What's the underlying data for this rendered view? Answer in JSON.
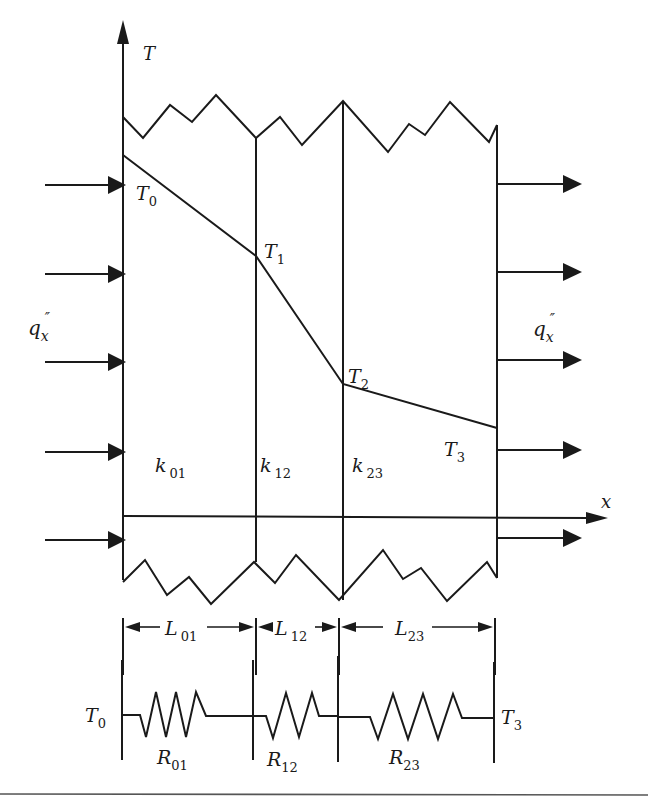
{
  "diagram": {
    "type": "composite-wall-heat-conduction",
    "axes": {
      "vertical_label": "T",
      "horizontal_label": "x"
    },
    "heat_flux": {
      "inlet_label": "q",
      "inlet_subscript": "x",
      "inlet_superscript": "″",
      "outlet_label": "q",
      "outlet_subscript": "x",
      "outlet_superscript": "″",
      "inlet_arrow_count": 5,
      "outlet_arrow_count": 5
    },
    "temperatures": [
      {
        "label": "T",
        "subscript": "0"
      },
      {
        "label": "T",
        "subscript": "1"
      },
      {
        "label": "T",
        "subscript": "2"
      },
      {
        "label": "T",
        "subscript": "3"
      }
    ],
    "layers": [
      {
        "conductivity_label": "k",
        "conductivity_subscript": "01",
        "thickness_label": "L",
        "thickness_subscript": "01",
        "resistance_label": "R",
        "resistance_subscript": "01"
      },
      {
        "conductivity_label": "k",
        "conductivity_subscript": "12",
        "thickness_label": "L",
        "thickness_subscript": "12",
        "resistance_label": "R",
        "resistance_subscript": "12"
      },
      {
        "conductivity_label": "k",
        "conductivity_subscript": "23",
        "thickness_label": "L",
        "thickness_subscript": "23",
        "resistance_label": "R",
        "resistance_subscript": "23"
      }
    ],
    "circuit": {
      "left_node": {
        "label": "T",
        "subscript": "0"
      },
      "right_node": {
        "label": "T",
        "subscript": "3"
      }
    }
  }
}
